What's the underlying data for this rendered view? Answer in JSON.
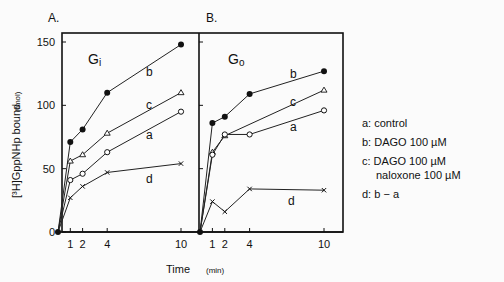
{
  "chart_data": [
    {
      "type": "line",
      "panel_label": "A.",
      "title": "Gi",
      "xlabel": "Time",
      "ylabel": "[3H]GppNHp bound (fmol)",
      "x": [
        0,
        1,
        2,
        4,
        10
      ],
      "xticks": [
        "1",
        "2",
        "4",
        "10"
      ],
      "yticks": [
        "0",
        "50",
        "100",
        "150"
      ],
      "ylim": [
        0,
        160
      ],
      "series": [
        {
          "name": "b",
          "marker": "filled-circle",
          "values": [
            0,
            71,
            81,
            110,
            148
          ]
        },
        {
          "name": "c",
          "marker": "open-triangle",
          "values": [
            0,
            56,
            61,
            78,
            110
          ]
        },
        {
          "name": "a",
          "marker": "open-circle",
          "values": [
            0,
            41,
            46,
            63,
            95
          ]
        },
        {
          "name": "d",
          "marker": "cross",
          "values": [
            0,
            27,
            36,
            47,
            54
          ]
        }
      ]
    },
    {
      "type": "line",
      "panel_label": "B.",
      "title": "Go",
      "xlabel": "(min)",
      "x": [
        0,
        1,
        2,
        4,
        10
      ],
      "xticks": [
        "1",
        "2",
        "4",
        "10"
      ],
      "ylim": [
        0,
        160
      ],
      "series": [
        {
          "name": "b",
          "marker": "filled-circle",
          "values": [
            0,
            86,
            91,
            109,
            127
          ]
        },
        {
          "name": "c",
          "marker": "open-triangle",
          "values": [
            0,
            63,
            76,
            null,
            112
          ]
        },
        {
          "name": "a",
          "marker": "open-circle",
          "values": [
            0,
            61,
            77,
            77,
            96
          ]
        },
        {
          "name": "d",
          "marker": "cross",
          "values": [
            0,
            24,
            16,
            34,
            33
          ]
        }
      ]
    }
  ],
  "legend": {
    "a": "a: control",
    "b": "b: DAGO  100 µM",
    "c1": "c: DAGO  100 µM",
    "c2": "naloxone  100 µM",
    "d": "d: b − a"
  },
  "labels": {
    "panelA": "A.",
    "panelB": "B.",
    "gi": "G",
    "gi_sub": "i",
    "go": "G",
    "go_sub": "o",
    "yaxis": "[³H]GppNHp bound",
    "yunit": "(fmol)",
    "time": "Time",
    "min": "(min)"
  }
}
